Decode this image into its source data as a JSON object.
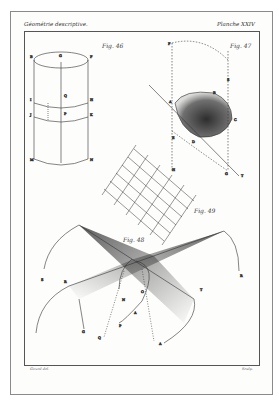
{
  "plate": {
    "header_left": "Géométrie descriptive.",
    "header_right": "Planche XXIV",
    "footer_left": "Girard del.",
    "footer_right": "Sculp."
  },
  "figures": [
    {
      "id": "fig46",
      "label": "Fig. 46",
      "subject": "cylinder",
      "points": [
        "B",
        "F",
        "G",
        "I",
        "H",
        "K",
        "J",
        "L",
        "O",
        "P",
        "Q",
        "M",
        "N"
      ]
    },
    {
      "id": "fig47",
      "label": "Fig. 47",
      "subject": "oblique-section",
      "points": [
        "A",
        "B",
        "C",
        "D",
        "E",
        "F",
        "G",
        "H",
        "S",
        "T"
      ]
    },
    {
      "id": "fig49",
      "label": "Fig. 49",
      "subject": "grid-net"
    },
    {
      "id": "fig48",
      "label": "Fig. 48",
      "subject": "intersecting-surfaces",
      "points": [
        "S",
        "R",
        "T",
        "N",
        "O",
        "P",
        "Q",
        "A",
        "B",
        "C",
        "G"
      ]
    }
  ],
  "colors": {
    "ink": "#333333",
    "frame": "#8a8a8a",
    "paper": "#fdfdfc",
    "shading": "#222222"
  }
}
